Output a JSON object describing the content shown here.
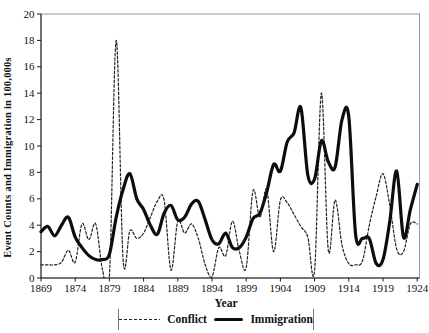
{
  "figure": {
    "background": "#ffffff",
    "frame_color": "#9a9a9a",
    "axis_color": "#1a1a1a",
    "text_color": "#111111"
  },
  "chart_data": {
    "type": "line",
    "title": "",
    "xlabel": "Year",
    "ylabel": "Event Counts and Immigration in 100,000s",
    "x_range": [
      1869,
      1924
    ],
    "y_range": [
      0,
      20
    ],
    "x_ticks": [
      1869,
      1874,
      1879,
      1884,
      1889,
      1894,
      1899,
      1904,
      1909,
      1914,
      1919,
      1924
    ],
    "y_ticks": [
      0,
      2,
      4,
      6,
      8,
      10,
      12,
      14,
      16,
      18,
      20
    ],
    "grid": false,
    "legend_position": "bottom",
    "x": [
      1869,
      1870,
      1871,
      1872,
      1873,
      1874,
      1875,
      1876,
      1877,
      1878,
      1879,
      1880,
      1881,
      1882,
      1883,
      1884,
      1885,
      1886,
      1887,
      1888,
      1889,
      1890,
      1891,
      1892,
      1893,
      1894,
      1895,
      1896,
      1897,
      1898,
      1899,
      1900,
      1901,
      1902,
      1903,
      1904,
      1905,
      1906,
      1907,
      1908,
      1909,
      1910,
      1911,
      1912,
      1913,
      1914,
      1915,
      1916,
      1917,
      1918,
      1919,
      1920,
      1921,
      1922,
      1923,
      1924
    ],
    "series": [
      {
        "name": "Conflict",
        "style": "dashed",
        "color": "#222222",
        "stroke_width": 1.2,
        "values": [
          1.0,
          1.0,
          1.0,
          1.2,
          2.1,
          1.2,
          4.1,
          2.9,
          4.1,
          0.6,
          0.1,
          18.0,
          1.4,
          3.6,
          3.0,
          3.4,
          4.6,
          5.8,
          5.9,
          0.6,
          4.3,
          3.4,
          4.1,
          3.0,
          1.0,
          0.1,
          2.3,
          1.7,
          4.3,
          2.0,
          0.8,
          6.6,
          4.6,
          6.7,
          2.0,
          5.9,
          5.7,
          4.8,
          3.9,
          3.1,
          0.6,
          14.0,
          2.1,
          5.9,
          2.5,
          1.1,
          1.0,
          1.3,
          4.0,
          6.2,
          7.9,
          5.5,
          2.2,
          2.0,
          4.1,
          4.1
        ]
      },
      {
        "name": "Immigration",
        "style": "solid",
        "color": "#0d0d0d",
        "stroke_width": 3.2,
        "values": [
          3.5,
          3.9,
          3.2,
          4.0,
          4.6,
          3.1,
          2.3,
          1.7,
          1.4,
          1.4,
          1.8,
          4.6,
          6.7,
          7.9,
          6.0,
          5.2,
          4.0,
          3.3,
          4.9,
          5.5,
          4.4,
          4.6,
          5.6,
          5.8,
          4.4,
          2.9,
          2.6,
          3.4,
          2.3,
          2.3,
          3.1,
          4.5,
          4.9,
          6.5,
          8.6,
          8.1,
          10.3,
          11.0,
          12.9,
          7.8,
          7.5,
          10.4,
          8.8,
          8.4,
          12.0,
          12.2,
          3.3,
          3.0,
          3.0,
          1.1,
          1.4,
          4.3,
          8.1,
          3.1,
          5.2,
          7.1
        ]
      }
    ]
  }
}
